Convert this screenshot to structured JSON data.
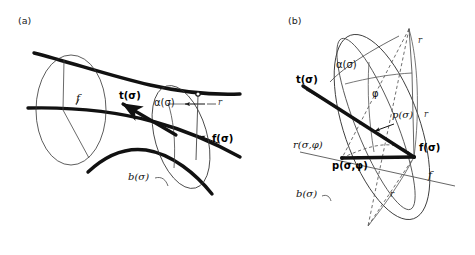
{
  "figure": {
    "background": "#ffffff",
    "ink": "#111111",
    "panels": [
      {
        "tag": "(a)",
        "description": "Generalized cylinder swept along a curve with moving frame vectors",
        "labels": [
          {
            "name": "f-italic",
            "text": "f",
            "style": "italic"
          },
          {
            "name": "tangent-vector",
            "text": "t(σ)",
            "style": "bold"
          },
          {
            "name": "alpha-curve",
            "text": "α(σ)",
            "style": "greek"
          },
          {
            "name": "radius",
            "text": "r",
            "style": "italic-small"
          },
          {
            "name": "f-vector",
            "text": "f(σ)",
            "style": "bold"
          },
          {
            "name": "b-curve",
            "text": "b(σ)",
            "style": "italic"
          }
        ]
      },
      {
        "tag": "(b)",
        "description": "Cross-section detail showing radius vector and sweep angle phi",
        "labels": [
          {
            "name": "alpha-curve",
            "text": "α(σ)",
            "style": "greek"
          },
          {
            "name": "tangent-vector",
            "text": "t(σ)",
            "style": "bold"
          },
          {
            "name": "phi-angle",
            "text": "φ",
            "style": "greek"
          },
          {
            "name": "radius-top",
            "text": "r",
            "style": "italic-small"
          },
          {
            "name": "radius-right",
            "text": "r",
            "style": "italic-small"
          },
          {
            "name": "radius-bottom",
            "text": "r",
            "style": "italic-small"
          },
          {
            "name": "p-sigma",
            "text": "p(σ)",
            "style": "italic"
          },
          {
            "name": "r-sigma-phi",
            "text": "r(σ,φ)",
            "style": "italic"
          },
          {
            "name": "p-sigma-phi",
            "text": "p(σ,φ)",
            "style": "bold"
          },
          {
            "name": "f-vector",
            "text": "f(σ)",
            "style": "bold"
          },
          {
            "name": "f-italic",
            "text": "f",
            "style": "italic"
          },
          {
            "name": "b-curve",
            "text": "b(σ)",
            "style": "italic"
          }
        ]
      }
    ]
  },
  "panel_a": {
    "tag": "(a)",
    "f_italic": "f",
    "t_sigma": "t(σ)",
    "alpha_sigma": "α(σ)",
    "r": "r",
    "f_sigma": "f(σ)",
    "b_sigma": "b(σ)"
  },
  "panel_b": {
    "tag": "(b)",
    "alpha_sigma": "α(σ)",
    "t_sigma": "t(σ)",
    "phi": "φ",
    "r_top": "r",
    "r_right": "r",
    "r_bottom": "r",
    "p_sigma": "p(σ)",
    "r_sigma_phi": "r(σ,φ)",
    "p_sigma_phi": "p(σ,φ)",
    "f_sigma": "f(σ)",
    "f_italic": "f",
    "b_sigma": "b(σ)"
  }
}
